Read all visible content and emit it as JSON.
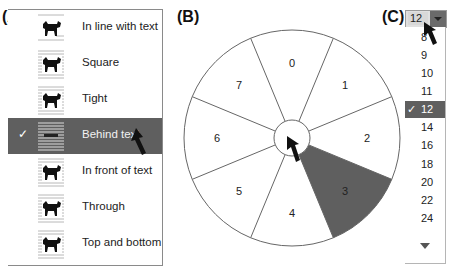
{
  "panels": {
    "a_label": "(A)",
    "b_label": "(B)",
    "c_label": "(C)"
  },
  "wrap_menu": {
    "items": [
      {
        "label": "In line with text",
        "icon": "wrap-inline-icon",
        "selected": false
      },
      {
        "label": "Square",
        "icon": "wrap-square-icon",
        "selected": false
      },
      {
        "label": "Tight",
        "icon": "wrap-tight-icon",
        "selected": false
      },
      {
        "label": "Behind text",
        "icon": "wrap-behind-icon",
        "selected": true
      },
      {
        "label": "In front of text",
        "icon": "wrap-infront-icon",
        "selected": false
      },
      {
        "label": "Through",
        "icon": "wrap-through-icon",
        "selected": false
      },
      {
        "label": "Top and bottom",
        "icon": "wrap-topbottom-icon",
        "selected": false
      }
    ],
    "check_mark": "✓",
    "selected_index": 3
  },
  "pie_menu": {
    "segments": [
      "0",
      "1",
      "2",
      "3",
      "4",
      "5",
      "6",
      "7"
    ],
    "selected_index": 3,
    "highlight_color": "#5f5f5f"
  },
  "font_size": {
    "current_value": "12",
    "options": [
      "8",
      "9",
      "10",
      "11",
      "12",
      "14",
      "16",
      "18",
      "20",
      "22",
      "24"
    ],
    "selected_index": 4,
    "check_mark": "✓"
  }
}
